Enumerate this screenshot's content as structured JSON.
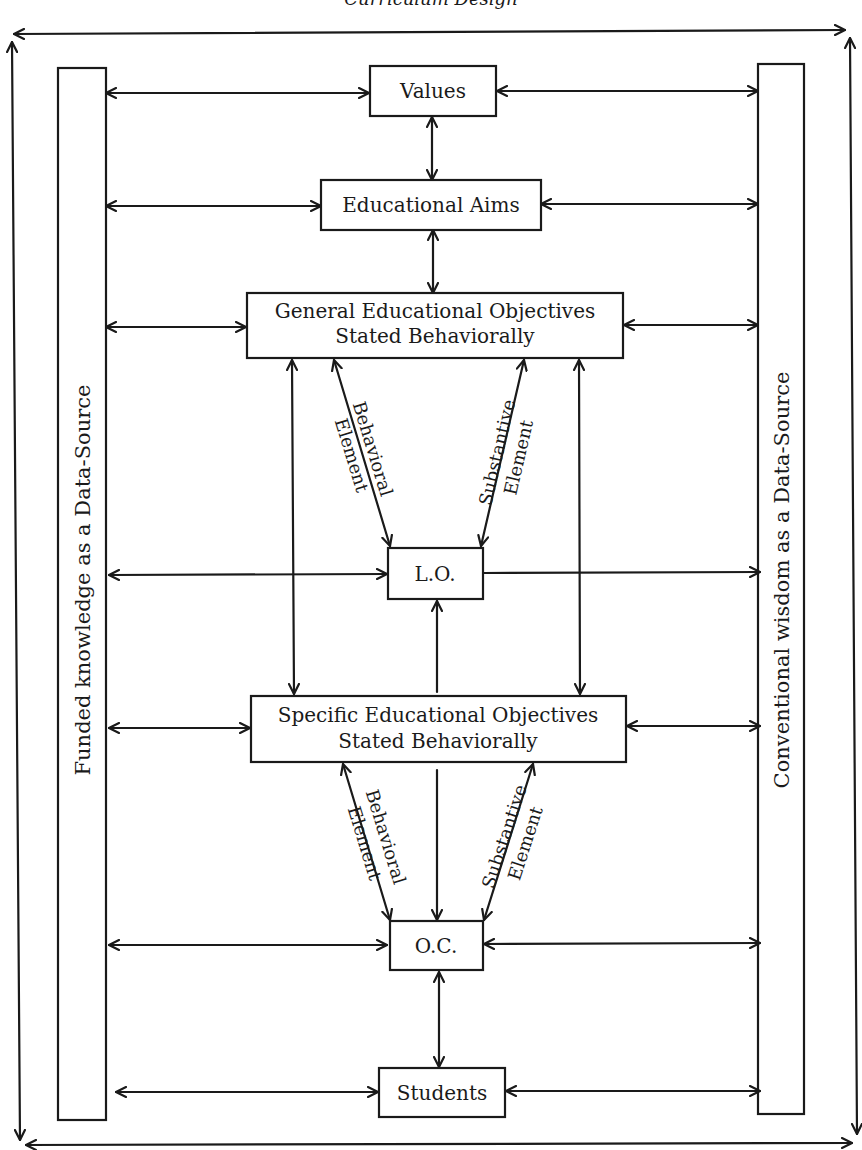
{
  "header": {
    "running_title": "Curriculum Design"
  },
  "colors": {
    "ink": "#1a1a1a",
    "background": "#ffffff"
  },
  "side_sources": {
    "left": "Funded knowledge as a Data-Source",
    "right": "Conventional wisdom as a Data-Source"
  },
  "nodes": {
    "values": "Values",
    "aims": "Educational Aims",
    "general_line1": "General Educational Objectives",
    "general_line2": "Stated Behaviorally",
    "lo": "L.O.",
    "specific_line1": "Specific Educational Objectives",
    "specific_line2": "Stated Behaviorally",
    "oc": "O.C.",
    "students": "Students"
  },
  "edge_labels": {
    "upper_behavioral_1": "Behavioral",
    "upper_behavioral_2": "Element",
    "upper_substantive_1": "Substantive",
    "upper_substantive_2": "Element",
    "lower_behavioral_1": "Behavioral",
    "lower_behavioral_2": "Element",
    "lower_substantive_1": "Substantive",
    "lower_substantive_2": "Element"
  }
}
